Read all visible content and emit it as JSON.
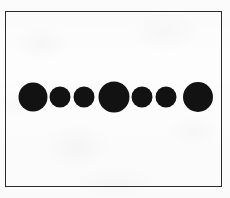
{
  "figure": {
    "medium": "scanned-line-drawing",
    "canvas": {
      "width": 230,
      "height": 198
    },
    "background_color": "#fdfdfd",
    "ink_color": "#121212"
  },
  "frame": {
    "name": "rectangular-border",
    "x": 5,
    "y": 11,
    "width": 217,
    "height": 176,
    "stroke_width": 1.4,
    "stroke_color": "#2b2b2b",
    "fill": "none"
  },
  "chart_data": {
    "type": "scatter",
    "xlabel": "",
    "ylabel": "",
    "grid": false,
    "legend": null,
    "xlim": [
      5,
      222
    ],
    "ylim": [
      11,
      187
    ],
    "marker_shape": "circle",
    "marker_fill": "#121212",
    "count": 7,
    "x": [
      33,
      60,
      84,
      114,
      142,
      166,
      198
    ],
    "y": [
      97,
      97,
      97,
      97,
      97,
      97,
      97
    ],
    "sizes_diameter_px": [
      29,
      21,
      21,
      31,
      21,
      21,
      30
    ],
    "size_labels": [
      "large",
      "small",
      "small",
      "large",
      "small",
      "small",
      "large"
    ],
    "points": [
      {
        "index": 1,
        "cx": 33,
        "cy": 97,
        "r": 14.5,
        "size": "large"
      },
      {
        "index": 2,
        "cx": 60,
        "cy": 97,
        "r": 10.5,
        "size": "small"
      },
      {
        "index": 3,
        "cx": 84,
        "cy": 97,
        "r": 10.5,
        "size": "small"
      },
      {
        "index": 4,
        "cx": 114,
        "cy": 97,
        "r": 15.5,
        "size": "large"
      },
      {
        "index": 5,
        "cx": 142,
        "cy": 97,
        "r": 10.5,
        "size": "small"
      },
      {
        "index": 6,
        "cx": 166,
        "cy": 97,
        "r": 10.5,
        "size": "small"
      },
      {
        "index": 7,
        "cx": 198,
        "cy": 97,
        "r": 15.0,
        "size": "large"
      }
    ]
  }
}
